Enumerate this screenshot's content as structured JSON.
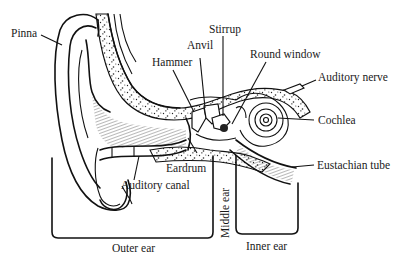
{
  "diagram": {
    "labels": {
      "pinna": "Pinna",
      "hammer": "Hammer",
      "anvil": "Anvil",
      "stirrup": "Stirrup",
      "round_window": "Round window",
      "auditory_nerve": "Auditory nerve",
      "cochlea": "Cochlea",
      "eustachian_tube": "Eustachian tube",
      "eardrum": "Eardrum",
      "auditory_canal": "Auditory canal"
    },
    "regions": {
      "outer_ear": "Outer ear",
      "middle_ear": "Middle ear",
      "inner_ear": "Inner ear"
    }
  }
}
